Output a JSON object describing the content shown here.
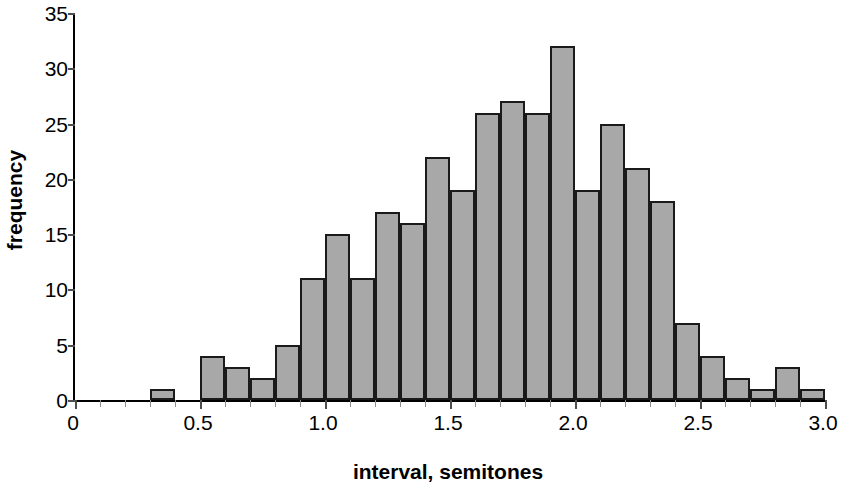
{
  "chart_data": {
    "type": "bar",
    "title": "",
    "subtitle": "",
    "xlabel": "interval, semitones",
    "ylabel": "frequency",
    "xlim": [
      0,
      3.0
    ],
    "ylim": [
      0,
      35
    ],
    "bin_width": 0.1,
    "grid": false,
    "legend": null,
    "x_major_ticks": [
      "0",
      "0.5",
      "1.0",
      "1.5",
      "2.0",
      "2.5",
      "3.0"
    ],
    "x_major_tick_values": [
      0,
      0.5,
      1.0,
      1.5,
      2.0,
      2.5,
      3.0
    ],
    "x_minor_tick_values": [
      0.1,
      0.2,
      0.3,
      0.4,
      0.6,
      0.7,
      0.8,
      0.9,
      1.1,
      1.2,
      1.3,
      1.4,
      1.6,
      1.7,
      1.8,
      1.9,
      2.1,
      2.2,
      2.3,
      2.4,
      2.6,
      2.7,
      2.8,
      2.9
    ],
    "y_ticks": [
      "0",
      "5",
      "10",
      "15",
      "20",
      "25",
      "30",
      "35"
    ],
    "y_tick_values": [
      0,
      5,
      10,
      15,
      20,
      25,
      30,
      35
    ],
    "bars": [
      {
        "bin_start": 0.3,
        "bin_end": 0.4,
        "value": 1
      },
      {
        "bin_start": 0.5,
        "bin_end": 0.6,
        "value": 4
      },
      {
        "bin_start": 0.6,
        "bin_end": 0.7,
        "value": 3
      },
      {
        "bin_start": 0.7,
        "bin_end": 0.8,
        "value": 2
      },
      {
        "bin_start": 0.8,
        "bin_end": 0.9,
        "value": 5
      },
      {
        "bin_start": 0.9,
        "bin_end": 1.0,
        "value": 11
      },
      {
        "bin_start": 1.0,
        "bin_end": 1.1,
        "value": 15
      },
      {
        "bin_start": 1.1,
        "bin_end": 1.2,
        "value": 11
      },
      {
        "bin_start": 1.2,
        "bin_end": 1.3,
        "value": 17
      },
      {
        "bin_start": 1.3,
        "bin_end": 1.4,
        "value": 16
      },
      {
        "bin_start": 1.4,
        "bin_end": 1.5,
        "value": 22
      },
      {
        "bin_start": 1.5,
        "bin_end": 1.6,
        "value": 19
      },
      {
        "bin_start": 1.6,
        "bin_end": 1.7,
        "value": 26
      },
      {
        "bin_start": 1.7,
        "bin_end": 1.8,
        "value": 27
      },
      {
        "bin_start": 1.8,
        "bin_end": 1.9,
        "value": 26
      },
      {
        "bin_start": 1.9,
        "bin_end": 2.0,
        "value": 32
      },
      {
        "bin_start": 2.0,
        "bin_end": 2.1,
        "value": 19
      },
      {
        "bin_start": 2.1,
        "bin_end": 2.2,
        "value": 25
      },
      {
        "bin_start": 2.2,
        "bin_end": 2.3,
        "value": 21
      },
      {
        "bin_start": 2.3,
        "bin_end": 2.4,
        "value": 18
      },
      {
        "bin_start": 2.4,
        "bin_end": 2.5,
        "value": 7
      },
      {
        "bin_start": 2.5,
        "bin_end": 2.6,
        "value": 4
      },
      {
        "bin_start": 2.6,
        "bin_end": 2.7,
        "value": 2
      },
      {
        "bin_start": 2.7,
        "bin_end": 2.8,
        "value": 1
      },
      {
        "bin_start": 2.8,
        "bin_end": 2.9,
        "value": 3
      },
      {
        "bin_start": 2.9,
        "bin_end": 3.0,
        "value": 1
      }
    ],
    "colors": {
      "bar_fill": "#a8a8a8",
      "bar_border": "#1a1a1a",
      "axis": "#000000",
      "tick": "#4d4d4d",
      "text": "#000000",
      "background": "#ffffff"
    }
  }
}
